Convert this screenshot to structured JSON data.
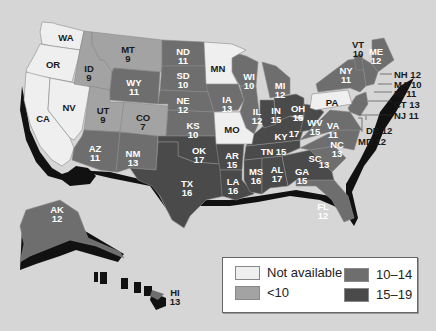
{
  "colors": {
    "background": "#d6d6d6",
    "not_available": "#efefef",
    "lt10": "#a3a3a3",
    "r10_14": "#6e6e6e",
    "r15_19": "#4a4a4a",
    "shadow": "#111111"
  },
  "legend": {
    "items": [
      {
        "label": "Not available",
        "category": "not_available"
      },
      {
        "label": "<10",
        "category": "lt10"
      },
      {
        "label": "10–14",
        "category": "r10_14"
      },
      {
        "label": "15–19",
        "category": "r15_19"
      }
    ]
  },
  "states": [
    {
      "abbr": "WA",
      "value": null
    },
    {
      "abbr": "OR",
      "value": null
    },
    {
      "abbr": "CA",
      "value": null
    },
    {
      "abbr": "NV",
      "value": null
    },
    {
      "abbr": "ID",
      "value": "9"
    },
    {
      "abbr": "MT",
      "value": "9"
    },
    {
      "abbr": "WY",
      "value": "11"
    },
    {
      "abbr": "UT",
      "value": "9"
    },
    {
      "abbr": "CO",
      "value": "7"
    },
    {
      "abbr": "AZ",
      "value": "11"
    },
    {
      "abbr": "NM",
      "value": "13"
    },
    {
      "abbr": "ND",
      "value": "11"
    },
    {
      "abbr": "SD",
      "value": "10"
    },
    {
      "abbr": "NE",
      "value": "12"
    },
    {
      "abbr": "KS",
      "value": "10"
    },
    {
      "abbr": "OK",
      "value": "17"
    },
    {
      "abbr": "TX",
      "value": "16"
    },
    {
      "abbr": "MN",
      "value": null
    },
    {
      "abbr": "IA",
      "value": "13"
    },
    {
      "abbr": "MO",
      "value": null
    },
    {
      "abbr": "AR",
      "value": "15"
    },
    {
      "abbr": "LA",
      "value": "16"
    },
    {
      "abbr": "WI",
      "value": "10"
    },
    {
      "abbr": "IL",
      "value": "12"
    },
    {
      "abbr": "MI",
      "value": "12"
    },
    {
      "abbr": "IN",
      "value": "15"
    },
    {
      "abbr": "OH",
      "value": "15"
    },
    {
      "abbr": "KY",
      "value": "17"
    },
    {
      "abbr": "TN",
      "value": "15"
    },
    {
      "abbr": "MS",
      "value": "16"
    },
    {
      "abbr": "AL",
      "value": "17"
    },
    {
      "abbr": "GA",
      "value": "15"
    },
    {
      "abbr": "FL",
      "value": "12"
    },
    {
      "abbr": "SC",
      "value": "13"
    },
    {
      "abbr": "NC",
      "value": "13"
    },
    {
      "abbr": "VA",
      "value": "11"
    },
    {
      "abbr": "WV",
      "value": "15"
    },
    {
      "abbr": "PA",
      "value": null
    },
    {
      "abbr": "NY",
      "value": "11"
    },
    {
      "abbr": "VT",
      "value": "10"
    },
    {
      "abbr": "ME",
      "value": "12"
    },
    {
      "abbr": "NH",
      "value": "12"
    },
    {
      "abbr": "MA",
      "value": "10"
    },
    {
      "abbr": "RI",
      "value": "11"
    },
    {
      "abbr": "CT",
      "value": "13"
    },
    {
      "abbr": "NJ",
      "value": "11"
    },
    {
      "abbr": "DE",
      "value": "12"
    },
    {
      "abbr": "MD",
      "value": "12"
    },
    {
      "abbr": "AK",
      "value": "12"
    },
    {
      "abbr": "HI",
      "value": "13"
    }
  ],
  "labels": {
    "WA": {
      "abbr": "WA",
      "value": ""
    },
    "OR": {
      "abbr": "OR",
      "value": ""
    },
    "CA": {
      "abbr": "CA",
      "value": ""
    },
    "NV": {
      "abbr": "NV",
      "value": ""
    },
    "MN": {
      "abbr": "MN",
      "value": ""
    },
    "MO": {
      "abbr": "MO",
      "value": ""
    },
    "PA": {
      "abbr": "PA",
      "value": ""
    },
    "ID": {
      "abbr": "ID",
      "value": "9"
    },
    "MT": {
      "abbr": "MT",
      "value": "9"
    },
    "WY": {
      "abbr": "WY",
      "value": "11"
    },
    "UT": {
      "abbr": "UT",
      "value": "9"
    },
    "CO": {
      "abbr": "CO",
      "value": "7"
    },
    "AZ": {
      "abbr": "AZ",
      "value": "11"
    },
    "NM": {
      "abbr": "NM",
      "value": "13"
    },
    "ND": {
      "abbr": "ND",
      "value": "11"
    },
    "SD": {
      "abbr": "SD",
      "value": "10"
    },
    "NE": {
      "abbr": "NE",
      "value": "12"
    },
    "KS": {
      "abbr": "KS",
      "value": "10"
    },
    "OK": {
      "abbr": "OK",
      "value": "17"
    },
    "TX": {
      "abbr": "TX",
      "value": "16"
    },
    "IA": {
      "abbr": "IA",
      "value": "13"
    },
    "AR": {
      "abbr": "AR",
      "value": "15"
    },
    "LA": {
      "abbr": "LA",
      "value": "16"
    },
    "WI": {
      "abbr": "WI",
      "value": "10"
    },
    "IL": {
      "abbr": "IL",
      "value": "12"
    },
    "MI": {
      "abbr": "MI",
      "value": "12"
    },
    "IN": {
      "abbr": "IN",
      "value": "15"
    },
    "OH": {
      "abbr": "OH",
      "value": "15"
    },
    "KY": {
      "abbr": "KY",
      "value": "17"
    },
    "TN": {
      "abbr": "TN",
      "value": "15"
    },
    "MS": {
      "abbr": "MS",
      "value": "16"
    },
    "AL": {
      "abbr": "AL",
      "value": "17"
    },
    "GA": {
      "abbr": "GA",
      "value": "15"
    },
    "FL": {
      "abbr": "FL",
      "value": "12"
    },
    "SC": {
      "abbr": "SC",
      "value": "13"
    },
    "NC": {
      "abbr": "NC",
      "value": "13"
    },
    "VA": {
      "abbr": "VA",
      "value": "11"
    },
    "WV": {
      "abbr": "WV",
      "value": "15"
    },
    "NY": {
      "abbr": "NY",
      "value": "11"
    },
    "VT": {
      "abbr": "VT",
      "value": "10"
    },
    "ME": {
      "abbr": "ME",
      "value": "12"
    },
    "AK": {
      "abbr": "AK",
      "value": "12"
    },
    "HI": {
      "abbr": "HI",
      "value": "13"
    }
  },
  "callouts": {
    "NH": "NH 12",
    "MA": "MA 10",
    "RI": "RI 11",
    "CT": "CT 13",
    "NJ": "NJ 11",
    "DE": "DE 12",
    "MD": "MD 12"
  }
}
